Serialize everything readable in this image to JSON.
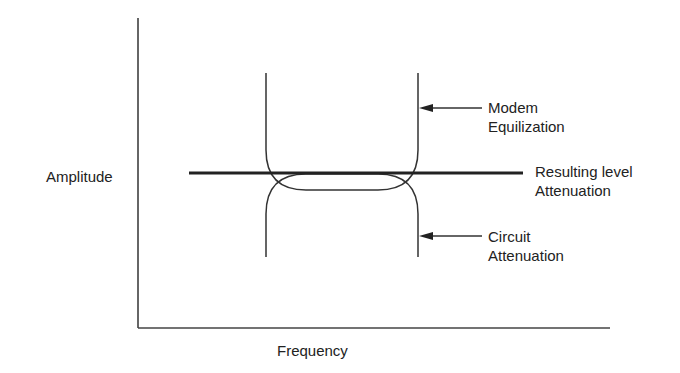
{
  "diagram": {
    "axes": {
      "y_label": "Amplitude",
      "x_label": "Frequency"
    },
    "labels": {
      "modem": [
        "Modem",
        "Equilization"
      ],
      "resulting": [
        "Resulting level",
        "Attenuation"
      ],
      "circuit": [
        "Circuit",
        "Attenuation"
      ]
    },
    "colors": {
      "line": "#333333",
      "background": "#ffffff"
    }
  }
}
